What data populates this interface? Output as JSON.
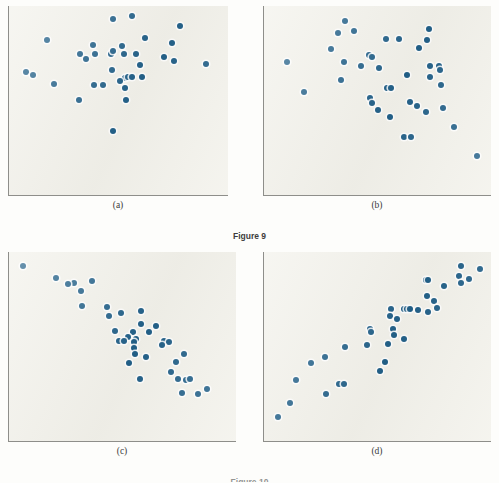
{
  "figure": {
    "caption": "Figure 9",
    "caption_bottom": "Figure 10",
    "dot_color": "#215f87",
    "panel_background": "#f2f1ea",
    "axis_color": "#8e8e8a",
    "page_background": "#fdfdfb"
  },
  "ghost_text": [
    {
      "text": "the relationship between two quantitative",
      "x": 36,
      "y": 30
    },
    {
      "text": "variables is shown by a scatterplot",
      "x": 60,
      "y": 44
    },
    {
      "text": "correlation measures the strength",
      "x": 44,
      "y": 96
    },
    {
      "text": "of a linear association",
      "x": 300,
      "y": 96
    },
    {
      "text": "positive and negative direction",
      "x": 40,
      "y": 118
    },
    {
      "text": "of the straight line pattern",
      "x": 300,
      "y": 120
    },
    {
      "text": "scatterplot displays",
      "x": 50,
      "y": 250
    },
    {
      "text": "form direction strength",
      "x": 280,
      "y": 250
    },
    {
      "text": "outliers",
      "x": 100,
      "y": 350
    }
  ],
  "panels": [
    {
      "id": "panel-a",
      "label": "(a)",
      "description": "no correlation",
      "chart_data": {
        "type": "scatter",
        "title": "(a)",
        "xlabel": "",
        "ylabel": "",
        "xlim": [
          0,
          100
        ],
        "ylim": [
          0,
          100
        ],
        "grid": false,
        "n_points": 35,
        "correlation": "near zero",
        "points": [
          [
            47.5,
            96.0
          ],
          [
            56.5,
            97.5
          ],
          [
            79.5,
            92.0
          ],
          [
            15.5,
            84.0
          ],
          [
            63.0,
            85.5
          ],
          [
            76.0,
            82.5
          ],
          [
            37.5,
            81.5
          ],
          [
            51.5,
            81.0
          ],
          [
            46.5,
            76.5
          ],
          [
            47.5,
            78.0
          ],
          [
            31.5,
            76.0
          ],
          [
            38.5,
            76.5
          ],
          [
            52.5,
            76.0
          ],
          [
            58.5,
            76.0
          ],
          [
            72.0,
            74.5
          ],
          [
            34.5,
            73.5
          ],
          [
            77.0,
            72.5
          ],
          [
            92.5,
            70.5
          ],
          [
            60.5,
            70.0
          ],
          [
            47.0,
            67.5
          ],
          [
            5.5,
            66.0
          ],
          [
            8.5,
            64.5
          ],
          [
            61.5,
            63.5
          ],
          [
            53.0,
            62.5
          ],
          [
            54.5,
            63.0
          ],
          [
            56.5,
            63.5
          ],
          [
            50.5,
            61.0
          ],
          [
            19.0,
            59.5
          ],
          [
            38.0,
            58.5
          ],
          [
            42.5,
            58.5
          ],
          [
            53.0,
            57.0
          ],
          [
            31.0,
            50.5
          ],
          [
            53.5,
            50.5
          ],
          [
            47.5,
            33.0
          ]
        ]
      }
    },
    {
      "id": "panel-b",
      "label": "(b)",
      "description": "weak negative correlation",
      "chart_data": {
        "type": "scatter",
        "title": "(b)",
        "xlabel": "",
        "ylabel": "",
        "xlim": [
          0,
          100
        ],
        "ylim": [
          0,
          100
        ],
        "grid": false,
        "n_points": 39,
        "correlation": "weak negative",
        "points": [
          [
            35.0,
            95.0
          ],
          [
            39.0,
            89.0
          ],
          [
            31.5,
            88.0
          ],
          [
            74.0,
            90.5
          ],
          [
            54.0,
            84.5
          ],
          [
            60.0,
            84.5
          ],
          [
            73.0,
            84.0
          ],
          [
            69.5,
            79.5
          ],
          [
            28.5,
            79.0
          ],
          [
            46.0,
            75.5
          ],
          [
            47.5,
            74.5
          ],
          [
            8.0,
            72.0
          ],
          [
            34.5,
            71.5
          ],
          [
            42.5,
            69.5
          ],
          [
            50.5,
            68.5
          ],
          [
            74.5,
            69.5
          ],
          [
            78.5,
            69.5
          ],
          [
            79.0,
            67.5
          ],
          [
            63.5,
            64.5
          ],
          [
            74.5,
            63.5
          ],
          [
            33.0,
            61.5
          ],
          [
            79.5,
            59.0
          ],
          [
            16.0,
            55.0
          ],
          [
            54.5,
            57.0
          ],
          [
            56.5,
            57.0
          ],
          [
            46.5,
            51.5
          ],
          [
            47.5,
            48.5
          ],
          [
            65.0,
            49.0
          ],
          [
            68.5,
            47.0
          ],
          [
            80.5,
            45.5
          ],
          [
            50.0,
            44.5
          ],
          [
            72.5,
            43.5
          ],
          [
            56.0,
            40.5
          ],
          [
            85.5,
            35.0
          ],
          [
            62.5,
            29.5
          ],
          [
            65.5,
            29.5
          ],
          [
            96.5,
            18.5
          ]
        ]
      }
    },
    {
      "id": "panel-c",
      "label": "(c)",
      "description": "strong negative correlation",
      "chart_data": {
        "type": "scatter",
        "title": "(c)",
        "xlabel": "",
        "ylabel": "",
        "xlim": [
          0,
          100
        ],
        "ylim": [
          0,
          100
        ],
        "grid": false,
        "n_points": 40,
        "correlation": "strong negative",
        "points": [
          [
            3.5,
            95.5
          ],
          [
            19.0,
            88.5
          ],
          [
            27.5,
            86.0
          ],
          [
            36.0,
            87.0
          ],
          [
            24.5,
            85.5
          ],
          [
            30.5,
            81.5
          ],
          [
            31.0,
            73.0
          ],
          [
            43.0,
            72.5
          ],
          [
            43.5,
            67.5
          ],
          [
            49.5,
            69.0
          ],
          [
            58.5,
            70.0
          ],
          [
            58.5,
            62.5
          ],
          [
            65.5,
            61.5
          ],
          [
            46.5,
            58.5
          ],
          [
            55.0,
            58.0
          ],
          [
            62.5,
            58.0
          ],
          [
            52.5,
            55.5
          ],
          [
            56.5,
            54.0
          ],
          [
            48.5,
            53.0
          ],
          [
            50.5,
            53.0
          ],
          [
            55.5,
            52.5
          ],
          [
            69.5,
            53.0
          ],
          [
            71.5,
            52.5
          ],
          [
            68.5,
            51.0
          ],
          [
            55.5,
            49.0
          ],
          [
            56.0,
            46.0
          ],
          [
            61.0,
            44.0
          ],
          [
            78.5,
            45.5
          ],
          [
            53.0,
            40.5
          ],
          [
            75.0,
            41.5
          ],
          [
            72.5,
            35.5
          ],
          [
            58.0,
            31.5
          ],
          [
            76.0,
            31.5
          ],
          [
            79.5,
            31.0
          ],
          [
            81.5,
            31.5
          ],
          [
            77.5,
            24.0
          ],
          [
            89.5,
            26.0
          ],
          [
            85.0,
            23.0
          ]
        ]
      }
    },
    {
      "id": "panel-d",
      "label": "(d)",
      "description": "strong positive correlation",
      "chart_data": {
        "type": "scatter",
        "title": "(d)",
        "xlabel": "",
        "ylabel": "",
        "xlim": [
          0,
          100
        ],
        "ylim": [
          0,
          100
        ],
        "grid": false,
        "n_points": 42,
        "correlation": "strong positive",
        "points": [
          [
            89.0,
            95.5
          ],
          [
            97.5,
            94.0
          ],
          [
            88.0,
            90.0
          ],
          [
            92.5,
            88.0
          ],
          [
            72.5,
            87.5
          ],
          [
            73.5,
            87.5
          ],
          [
            89.0,
            86.0
          ],
          [
            81.0,
            84.0
          ],
          [
            73.0,
            78.5
          ],
          [
            76.5,
            75.5
          ],
          [
            77.5,
            72.0
          ],
          [
            56.5,
            71.0
          ],
          [
            62.5,
            71.0
          ],
          [
            63.5,
            71.0
          ],
          [
            65.0,
            71.0
          ],
          [
            69.0,
            70.5
          ],
          [
            73.5,
            69.5
          ],
          [
            56.0,
            67.0
          ],
          [
            59.0,
            65.5
          ],
          [
            46.5,
            60.0
          ],
          [
            47.0,
            58.0
          ],
          [
            57.0,
            60.0
          ],
          [
            57.5,
            56.5
          ],
          [
            62.5,
            54.5
          ],
          [
            45.0,
            51.0
          ],
          [
            55.0,
            51.5
          ],
          [
            35.0,
            50.0
          ],
          [
            25.5,
            44.0
          ],
          [
            19.0,
            40.5
          ],
          [
            53.5,
            41.5
          ],
          [
            51.0,
            36.0
          ],
          [
            12.0,
            31.0
          ],
          [
            32.0,
            29.0
          ],
          [
            34.5,
            29.0
          ],
          [
            26.0,
            23.0
          ],
          [
            9.5,
            18.0
          ],
          [
            3.5,
            10.0
          ]
        ]
      }
    }
  ]
}
